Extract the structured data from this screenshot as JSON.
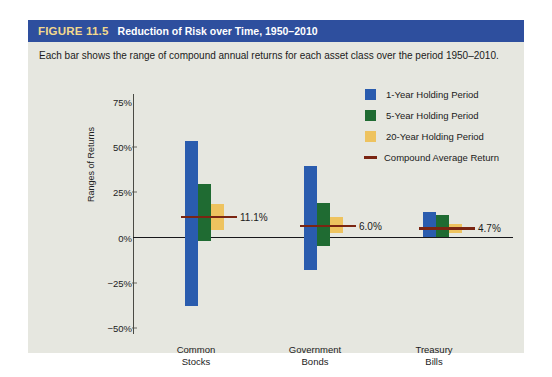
{
  "figure": {
    "number": "FIGURE 11.5",
    "title": "Reduction of Risk over Time, 1950–2010",
    "subtitle": "Each bar shows the range of compound annual returns for each asset class over the period 1950–2010.",
    "header_color": "#2e4f9e",
    "number_color": "#f2d98d",
    "panel_color": "#e6e7e0"
  },
  "chart_data": {
    "type": "bar",
    "title": "Reduction of Risk over Time, 1950–2010",
    "xlabel": "",
    "ylabel": "Ranges of Returns",
    "ylim": [
      -50,
      75
    ],
    "yticks": [
      "75%",
      "50%",
      "25%",
      "0%",
      "−25%",
      "−50%"
    ],
    "ytick_values": [
      75,
      50,
      25,
      0,
      -25,
      -50
    ],
    "grid": false,
    "legend_position": "upper right",
    "categories": [
      "Common Stocks",
      "Government Bonds",
      "Treasury Bills"
    ],
    "series": [
      {
        "name": "1-Year Holding Period",
        "color": "#2a5cae",
        "ranges": [
          {
            "high": 53,
            "low": -38
          },
          {
            "high": 39,
            "low": -18
          },
          {
            "high": 14,
            "low": 0
          }
        ]
      },
      {
        "name": "5-Year Holding Period",
        "color": "#1f6b32",
        "ranges": [
          {
            "high": 29,
            "low": -2
          },
          {
            "high": 19,
            "low": -5
          },
          {
            "high": 12,
            "low": 0
          }
        ]
      },
      {
        "name": "20-Year Holding Period",
        "color": "#eec35f",
        "ranges": [
          {
            "high": 18,
            "low": 4
          },
          {
            "high": 11,
            "low": 2
          },
          {
            "high": 7,
            "low": 2
          }
        ]
      }
    ],
    "compound_average_return": {
      "name": "Compound Average Return",
      "color": "#7a2512",
      "values": [
        11.1,
        6.0,
        4.7
      ],
      "labels": [
        "11.1%",
        "6.0%",
        "4.7%"
      ]
    }
  },
  "legend": {
    "items": [
      {
        "label": "1-Year Holding Period",
        "marker": "square-swatch-blue"
      },
      {
        "label": "5-Year Holding Period",
        "marker": "square-swatch-green"
      },
      {
        "label": "20-Year Holding Period",
        "marker": "square-swatch-yellow"
      },
      {
        "label": "Compound Average Return",
        "marker": "line-swatch-dark-red"
      }
    ]
  },
  "axis": {
    "y_label": "Ranges of Returns",
    "ticks": [
      "75%",
      "50%",
      "25%",
      "0%",
      "−25%",
      "−50%"
    ]
  },
  "categories": [
    {
      "line1": "Common",
      "line2": "Stocks"
    },
    {
      "line1": "Government",
      "line2": "Bonds"
    },
    {
      "line1": "Treasury",
      "line2": "Bills"
    }
  ]
}
